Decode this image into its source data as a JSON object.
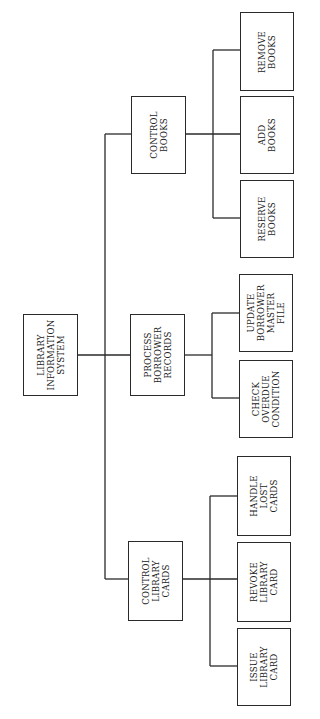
{
  "diagram": {
    "type": "hierarchy-chart",
    "orientation": "rotated-90-ccw",
    "root": {
      "id": "root",
      "label": "LIBRARY\nINFORMATION\nSYSTEM",
      "box": {
        "x": 23,
        "y": 314,
        "w": 55,
        "h": 82
      }
    },
    "modules": [
      {
        "id": "control-books",
        "label": "CONTROL\nBOOKS",
        "box": {
          "x": 131,
          "y": 96,
          "w": 55,
          "h": 78
        },
        "children": [
          {
            "id": "remove-books",
            "label": "REMOVE\nBOOKS",
            "box": {
              "x": 240,
              "y": 12,
              "w": 54,
              "h": 79
            }
          },
          {
            "id": "add-books",
            "label": "ADD\nBOOKS",
            "box": {
              "x": 240,
              "y": 96,
              "w": 54,
              "h": 78
            }
          },
          {
            "id": "reserve-books",
            "label": "RESERVE\nBOOKS",
            "box": {
              "x": 240,
              "y": 180,
              "w": 54,
              "h": 78
            }
          }
        ]
      },
      {
        "id": "process-borrower-records",
        "label": "PROCESS\nBORROWER\nRECORDS",
        "box": {
          "x": 130,
          "y": 314,
          "w": 55,
          "h": 82
        },
        "children": [
          {
            "id": "update-borrower-master-file",
            "label": "UPDATE\nBORROWER\nMASTER\nFILE",
            "box": {
              "x": 239,
              "y": 274,
              "w": 54,
              "h": 78
            }
          },
          {
            "id": "check-overdue-condition",
            "label": "CHECK\nOVERDUE\nCONDITION",
            "box": {
              "x": 239,
              "y": 360,
              "w": 54,
              "h": 78
            }
          }
        ]
      },
      {
        "id": "control-library-cards",
        "label": "CONTROL\nLIBRARY\nCARDS",
        "box": {
          "x": 128,
          "y": 541,
          "w": 55,
          "h": 80
        },
        "children": [
          {
            "id": "handle-lost-cards",
            "label": "HANDLE\nLOST\nCARDS",
            "box": {
              "x": 237,
              "y": 456,
              "w": 54,
              "h": 80
            }
          },
          {
            "id": "revoke-library-card",
            "label": "REVOKE\nLIBRARY\nCARD",
            "box": {
              "x": 237,
              "y": 542,
              "w": 54,
              "h": 80
            }
          },
          {
            "id": "issue-library-card",
            "label": "ISSUE\nLIBRARY\nCARD",
            "box": {
              "x": 237,
              "y": 628,
              "w": 54,
              "h": 78
            }
          }
        ]
      }
    ],
    "line_color": "#2a2a2a"
  }
}
